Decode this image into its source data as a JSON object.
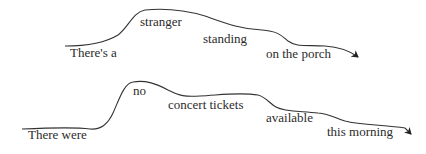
{
  "diagrams": [
    {
      "name": "intonation-contour-1",
      "words": [
        {
          "text": "There's a",
          "x": 70,
          "y": 53
        },
        {
          "text": "stranger",
          "x": 140,
          "y": 21
        },
        {
          "text": "standing",
          "x": 203,
          "y": 38
        },
        {
          "text": "on the porch",
          "x": 266,
          "y": 53
        }
      ]
    },
    {
      "name": "intonation-contour-2",
      "words": [
        {
          "text": "There were",
          "x": 28,
          "y": 134
        },
        {
          "text": "no",
          "x": 133,
          "y": 90
        },
        {
          "text": "concert tickets",
          "x": 168,
          "y": 104
        },
        {
          "text": "available",
          "x": 266,
          "y": 117
        },
        {
          "text": "this morning",
          "x": 327,
          "y": 131
        }
      ]
    }
  ],
  "colors": {
    "line": "#333333",
    "text": "#2b2b2b",
    "background": "#ffffff"
  }
}
